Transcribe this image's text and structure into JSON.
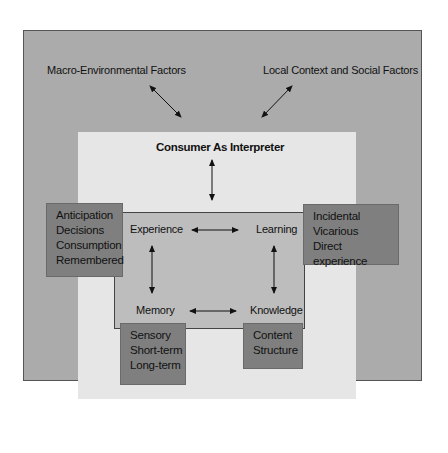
{
  "diagram": {
    "top_left_label": "Macro-Environmental Factors",
    "top_right_label": "Local Context and Social Factors",
    "center_title": "Consumer As Interpreter",
    "nodes": {
      "experience": "Experience",
      "learning": "Learning",
      "memory": "Memory",
      "knowledge": "Knowledge"
    },
    "experience_box": [
      "Anticipation",
      "Decisions",
      "Consumption",
      "Remembered"
    ],
    "learning_box": [
      "Incidental",
      "Vicarious",
      "Direct experience"
    ],
    "memory_box": [
      "Sensory",
      "Short-term",
      "Long-term"
    ],
    "knowledge_box": [
      "Content",
      "Structure"
    ]
  },
  "colors": {
    "outer_panel": "#ababab",
    "light_panel": "#e6e6e6",
    "inner_panel": "#bdbdbd",
    "dark_box": "#7f7f7f",
    "text": "#111111"
  }
}
